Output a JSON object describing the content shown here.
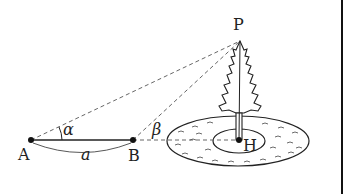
{
  "diagram": {
    "type": "geometry-word-problem",
    "points": {
      "A": {
        "label": "A",
        "x": 31,
        "y": 140
      },
      "B": {
        "label": "B",
        "x": 133,
        "y": 140
      },
      "P": {
        "label": "P",
        "x": 240,
        "y": 41
      },
      "H": {
        "label": "H",
        "x": 239,
        "y": 140
      }
    },
    "angles": {
      "alpha": {
        "label": "α",
        "at": "A"
      },
      "beta": {
        "label": "β",
        "at": "B"
      }
    },
    "segments": {
      "AB_length_label": "a"
    },
    "lines": [
      {
        "from": "A",
        "to": "B",
        "style": "solid"
      },
      {
        "from": "A",
        "to": "P",
        "style": "dashed"
      },
      {
        "from": "B",
        "to": "P",
        "style": "dashed"
      },
      {
        "from": "B",
        "to": "H",
        "style": "dashed"
      },
      {
        "from": "P",
        "to": "H",
        "style": "solid"
      }
    ],
    "pond": {
      "outer": "ellipse",
      "inner": "ellipse (island)"
    },
    "colors": {
      "stroke": "#222222",
      "dashed": "#555555"
    }
  }
}
